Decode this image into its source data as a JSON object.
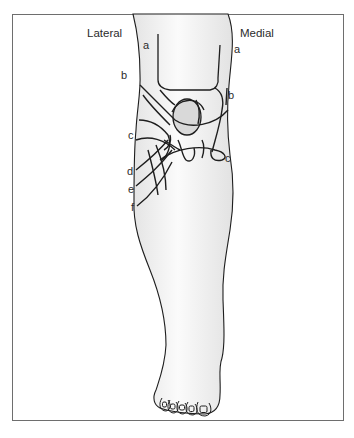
{
  "figure": {
    "title_left": "Lateral",
    "title_right": "Medial",
    "labels_lateral": [
      {
        "text": "a",
        "x": 143,
        "y": 41
      },
      {
        "text": "b",
        "x": 121,
        "y": 72
      },
      {
        "text": "c",
        "x": 128,
        "y": 131
      },
      {
        "text": "d",
        "x": 128,
        "y": 167
      },
      {
        "text": "e",
        "x": 128,
        "y": 185
      },
      {
        "text": "f",
        "x": 131,
        "y": 203
      }
    ],
    "labels_medial": [
      {
        "text": "a",
        "x": 234,
        "y": 46
      },
      {
        "text": "b",
        "x": 228,
        "y": 91
      },
      {
        "text": "c",
        "x": 225,
        "y": 154
      }
    ],
    "colors": {
      "outline": "#1e1e1e",
      "skin": "#f2f2f2",
      "patella": "#d9d9d9",
      "frame": "#6e6e6e"
    }
  }
}
